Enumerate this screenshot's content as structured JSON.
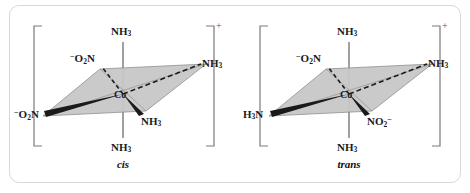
{
  "figure": {
    "kind": "coordination-complex-isomers",
    "border_color": "#d8d8d8",
    "plane_fill": "#c8c8c8",
    "plane_stroke": "#8a8a8a",
    "bond_color": "#1a1a1a",
    "axis_color": "#6e6e6e",
    "charge_color": "#555555"
  },
  "cis": {
    "name": "cis",
    "charge": "+",
    "metal": "Co",
    "ligands": {
      "top_axial": "NH3",
      "bottom_axial": "NH3",
      "back_left": "-O2N",
      "front_left": "-O2N",
      "back_right": "NH3",
      "front_right": "NH3"
    },
    "labels": {
      "metal": "Co",
      "top_axial": "NH",
      "top_axial_sub": "3",
      "bottom_axial": "NH",
      "bottom_axial_sub": "3",
      "back_left_sup": "−",
      "back_left": "O",
      "back_left_sub": "2",
      "back_left_tail": "N",
      "front_left_sup": "−",
      "front_left": "O",
      "front_left_sub": "2",
      "front_left_tail": "N",
      "back_right": "NH",
      "back_right_sub": "3",
      "front_right": "NH",
      "front_right_sub": "3"
    }
  },
  "trans": {
    "name": "trans",
    "charge": "+",
    "metal": "Co",
    "ligands": {
      "top_axial": "NH3",
      "bottom_axial": "NH3",
      "back_left": "-O2N",
      "front_left": "H3N",
      "back_right": "NH3",
      "front_right": "NO2-"
    },
    "labels": {
      "metal": "Co",
      "top_axial": "NH",
      "top_axial_sub": "3",
      "bottom_axial": "NH",
      "bottom_axial_sub": "3",
      "back_left_sup": "−",
      "back_left": "O",
      "back_left_sub": "2",
      "back_left_tail": "N",
      "front_left": "H",
      "front_left_sub": "3",
      "front_left_tail": "N",
      "back_right": "NH",
      "back_right_sub": "3",
      "front_right": "NO",
      "front_right_sub": "2",
      "front_right_sup": "−"
    }
  }
}
